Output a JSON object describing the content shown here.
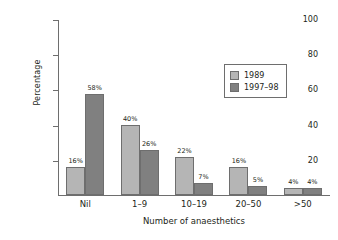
{
  "chart_data": {
    "type": "bar",
    "title": "",
    "subtitle": "",
    "xlabel": "Number of anaesthetics",
    "ylabel": "Percentage",
    "categories": [
      "Nil",
      "1–9",
      "10–19",
      "20–50",
      ">50"
    ],
    "series": [
      {
        "name": "1989",
        "color": "#b5b5b5",
        "values": [
          16,
          40,
          22,
          16,
          4
        ],
        "labels": [
          "16%",
          "40%",
          "22%",
          "16%",
          "4%"
        ]
      },
      {
        "name": "1997–98",
        "color": "#808080",
        "values": [
          58,
          26,
          7,
          5,
          4
        ],
        "labels": [
          "58%",
          "26%",
          "7%",
          "5%",
          "4%"
        ]
      }
    ],
    "ylim": [
      0,
      100
    ],
    "yticks": [
      20,
      40,
      60,
      80,
      100
    ],
    "ytick_labels": [
      "20",
      "40",
      "60",
      "80",
      "100"
    ],
    "grid": false,
    "legend_position": "top-right",
    "value_label_suffix": "%",
    "axis_color": "#6e6e6e",
    "background": "#ffffff"
  }
}
